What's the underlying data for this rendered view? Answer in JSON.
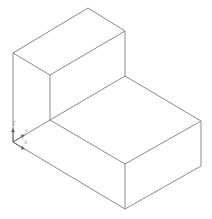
{
  "viewport": {
    "width": 212,
    "height": 219,
    "background": "#ffffff"
  },
  "colors": {
    "edge": "#8a8a8a",
    "axis": "#6a6a6a",
    "axis_label": "#9a9a9a"
  },
  "model": {
    "name": "L-shaped isometric block",
    "edges": [
      {
        "id": "upper-top-back-left",
        "x1": 13,
        "y1": 53,
        "x2": 88,
        "y2": 8
      },
      {
        "id": "upper-top-back-right",
        "x1": 88,
        "y1": 8,
        "x2": 125,
        "y2": 31
      },
      {
        "id": "upper-top-front-left",
        "x1": 13,
        "y1": 53,
        "x2": 50,
        "y2": 75
      },
      {
        "id": "upper-top-front-right",
        "x1": 50,
        "y1": 75,
        "x2": 125,
        "y2": 31
      },
      {
        "id": "upper-left-vertical",
        "x1": 13,
        "y1": 53,
        "x2": 13,
        "y2": 142
      },
      {
        "id": "upper-front-vertical",
        "x1": 50,
        "y1": 75,
        "x2": 50,
        "y2": 120
      },
      {
        "id": "upper-right-vertical",
        "x1": 125,
        "y1": 31,
        "x2": 125,
        "y2": 76
      },
      {
        "id": "step-left-edge",
        "x1": 13,
        "y1": 142,
        "x2": 50,
        "y2": 120
      },
      {
        "id": "step-back-edge",
        "x1": 50,
        "y1": 120,
        "x2": 125,
        "y2": 76
      },
      {
        "id": "lower-top-right-back",
        "x1": 125,
        "y1": 76,
        "x2": 201,
        "y2": 121
      },
      {
        "id": "lower-top-front-diag",
        "x1": 50,
        "y1": 120,
        "x2": 125,
        "y2": 164
      },
      {
        "id": "lower-top-front-right",
        "x1": 125,
        "y1": 164,
        "x2": 201,
        "y2": 121
      },
      {
        "id": "lower-front-left-bottom",
        "x1": 13,
        "y1": 142,
        "x2": 125,
        "y2": 209
      },
      {
        "id": "lower-front-vertical",
        "x1": 125,
        "y1": 164,
        "x2": 125,
        "y2": 209
      },
      {
        "id": "lower-right-vertical",
        "x1": 201,
        "y1": 121,
        "x2": 201,
        "y2": 166
      },
      {
        "id": "lower-right-bottom",
        "x1": 125,
        "y1": 209,
        "x2": 201,
        "y2": 166
      }
    ]
  },
  "triad": {
    "origin": {
      "x": 13,
      "y": 142
    },
    "axes": [
      {
        "name": "Z",
        "x2": 13,
        "y2": 129,
        "label_x": 12,
        "label_y": 125
      },
      {
        "name": "Y",
        "x2": 24,
        "y2": 135,
        "label_x": 25,
        "label_y": 133
      },
      {
        "name": "X",
        "x2": 24,
        "y2": 149,
        "label_x": 24,
        "label_y": 144
      }
    ]
  }
}
